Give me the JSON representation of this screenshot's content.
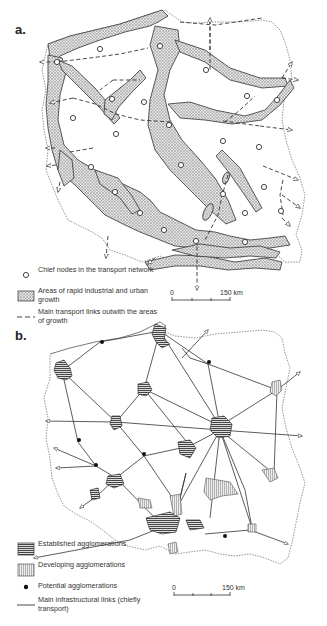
{
  "figure": {
    "panels": [
      {
        "label": "a.",
        "legend": [
          {
            "symbol": "open-circle",
            "text": "Chief nodes in the transport network"
          },
          {
            "symbol": "stippled-area",
            "text": "Areas of rapid industrial and urban growth"
          },
          {
            "symbol": "dashed-line",
            "text": "Main transport links outwith the areas of growth"
          }
        ],
        "scale": {
          "start": "0",
          "end": "150 km"
        }
      },
      {
        "label": "b.",
        "legend": [
          {
            "symbol": "horizontal-hatch",
            "text": "Established agglomerations"
          },
          {
            "symbol": "vertical-hatch",
            "text": "Developing agglomerations"
          },
          {
            "symbol": "filled-dot",
            "text": "Potential agglomerations"
          },
          {
            "symbol": "solid-line",
            "text": "Main infrastructural links (chiefly transport)"
          }
        ],
        "scale": {
          "start": "0",
          "end": "150 km"
        }
      }
    ]
  },
  "colors": {
    "stipple": "#b8b8b8",
    "line": "#333333",
    "border": "#777777",
    "established": "#555555",
    "developing": "#bbbbbb"
  }
}
